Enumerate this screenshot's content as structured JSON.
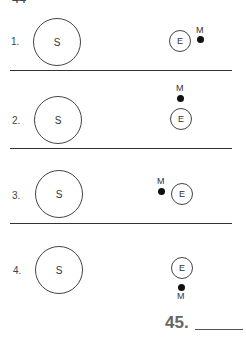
{
  "page": {
    "top_fragment": "44"
  },
  "options": [
    {
      "number": "1.",
      "sun_label": "S",
      "earth_label": "E",
      "moon_label": "M",
      "moon_position": "right"
    },
    {
      "number": "2.",
      "sun_label": "S",
      "earth_label": "E",
      "moon_label": "M",
      "moon_position": "above"
    },
    {
      "number": "3.",
      "sun_label": "S",
      "earth_label": "E",
      "moon_label": "M",
      "moon_position": "left"
    },
    {
      "number": "4.",
      "sun_label": "S",
      "earth_label": "E",
      "moon_label": "M",
      "moon_position": "below"
    }
  ],
  "question": {
    "number": "45.",
    "answer": ""
  }
}
